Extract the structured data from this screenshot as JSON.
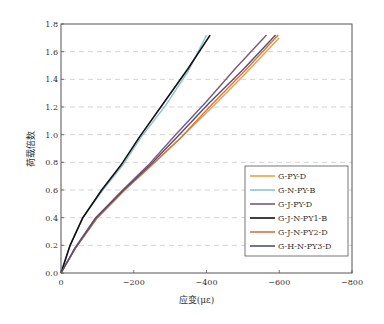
{
  "chart_data": {
    "type": "line",
    "title": "",
    "xlabel": "应变(με)",
    "ylabel": "荷载倍数",
    "xlim": [
      0,
      -800
    ],
    "ylim": [
      0,
      1.8
    ],
    "xticks": [
      0,
      -200,
      -400,
      -600,
      -800
    ],
    "xtick_labels": [
      "0",
      "-200",
      "-400",
      "-600",
      "-800"
    ],
    "yticks": [
      0.0,
      0.2,
      0.4,
      0.6,
      0.8,
      1.0,
      1.2,
      1.4,
      1.6,
      1.8
    ],
    "ytick_labels": [
      "0.0",
      "0.2",
      "0.4",
      "0.6",
      "0.8",
      "1.0",
      "1.2",
      "1.4",
      "1.6",
      "1.8"
    ],
    "grid": "horizontal-dashed",
    "legend_position": "bottom-right",
    "series": [
      {
        "name": "G-PY-D",
        "color": "#f0a040",
        "x": [
          0,
          -40,
          -100,
          -175,
          -250,
          -330,
          -420,
          -510,
          -600
        ],
        "y": [
          0,
          0.18,
          0.4,
          0.6,
          0.78,
          0.98,
          1.21,
          1.45,
          1.7
        ]
      },
      {
        "name": "G-N-PY-B",
        "color": "#8cc4d0",
        "x": [
          0,
          -25,
          -60,
          -115,
          -170,
          -220,
          -290,
          -350,
          -400
        ],
        "y": [
          0,
          0.2,
          0.4,
          0.6,
          0.78,
          0.98,
          1.22,
          1.46,
          1.72
        ]
      },
      {
        "name": "G-J-PY-D",
        "color": "#7a5a7a",
        "x": [
          0,
          -38,
          -95,
          -170,
          -240,
          -315,
          -400,
          -480,
          -565
        ],
        "y": [
          0,
          0.18,
          0.4,
          0.6,
          0.78,
          1.0,
          1.24,
          1.48,
          1.72
        ]
      },
      {
        "name": "G-J-N-PY1-B",
        "color": "#111111",
        "x": [
          0,
          -25,
          -60,
          -112,
          -165,
          -215,
          -285,
          -350,
          -410
        ],
        "y": [
          0,
          0.2,
          0.4,
          0.6,
          0.78,
          0.98,
          1.24,
          1.48,
          1.72
        ]
      },
      {
        "name": "G-J-N-PY2-D",
        "color": "#e07040",
        "x": [
          0,
          -40,
          -100,
          -175,
          -250,
          -330,
          -415,
          -505,
          -597
        ],
        "y": [
          0,
          0.18,
          0.4,
          0.6,
          0.78,
          0.98,
          1.22,
          1.46,
          1.72
        ]
      },
      {
        "name": "G-H-N-PY3-D",
        "color": "#50507a",
        "x": [
          0,
          -39,
          -97,
          -172,
          -245,
          -322,
          -408,
          -500,
          -590
        ],
        "y": [
          0,
          0.18,
          0.4,
          0.6,
          0.78,
          0.99,
          1.23,
          1.47,
          1.72
        ]
      }
    ]
  }
}
